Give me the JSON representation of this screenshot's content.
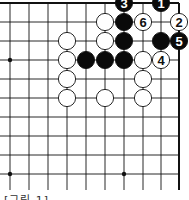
{
  "diagram": {
    "type": "go-board-partial",
    "corner": "top-right",
    "columns_x": [
      10,
      29,
      48,
      67,
      86,
      105,
      124,
      143,
      161,
      179
    ],
    "rows_y": [
      3,
      22,
      41,
      60,
      79,
      98,
      117,
      136,
      155,
      174
    ],
    "edges": {
      "top": true,
      "right": true,
      "left": false,
      "bottom": false
    },
    "star_points": [
      {
        "col": 0,
        "row": 3
      },
      {
        "col": 0,
        "row": 9
      },
      {
        "col": 6,
        "row": 9
      }
    ],
    "stones": [
      {
        "col": 6,
        "row": 0,
        "color": "black",
        "label": "3"
      },
      {
        "col": 8,
        "row": 0,
        "color": "black",
        "label": "1"
      },
      {
        "col": 5,
        "row": 1,
        "color": "white",
        "label": ""
      },
      {
        "col": 6,
        "row": 1,
        "color": "black",
        "label": ""
      },
      {
        "col": 7,
        "row": 1,
        "color": "white",
        "label": "6"
      },
      {
        "col": 9,
        "row": 1,
        "color": "white",
        "label": "2"
      },
      {
        "col": 3,
        "row": 2,
        "color": "white",
        "label": ""
      },
      {
        "col": 5,
        "row": 2,
        "color": "white",
        "label": ""
      },
      {
        "col": 6,
        "row": 2,
        "color": "black",
        "label": ""
      },
      {
        "col": 8,
        "row": 2,
        "color": "black",
        "label": ""
      },
      {
        "col": 9,
        "row": 2,
        "color": "black",
        "label": "5"
      },
      {
        "col": 3,
        "row": 3,
        "color": "white",
        "label": ""
      },
      {
        "col": 4,
        "row": 3,
        "color": "black",
        "label": ""
      },
      {
        "col": 5,
        "row": 3,
        "color": "black",
        "label": ""
      },
      {
        "col": 6,
        "row": 3,
        "color": "black",
        "label": ""
      },
      {
        "col": 7,
        "row": 3,
        "color": "white",
        "label": ""
      },
      {
        "col": 8,
        "row": 3,
        "color": "white",
        "label": "4"
      },
      {
        "col": 3,
        "row": 4,
        "color": "white",
        "label": ""
      },
      {
        "col": 7,
        "row": 4,
        "color": "white",
        "label": ""
      },
      {
        "col": 3,
        "row": 5,
        "color": "white",
        "label": ""
      },
      {
        "col": 5,
        "row": 5,
        "color": "white",
        "label": ""
      },
      {
        "col": 7,
        "row": 5,
        "color": "white",
        "label": ""
      }
    ],
    "colors": {
      "line": "#111111",
      "black_stone": "#0a0a0a",
      "white_stone": "#ffffff",
      "stone_outline": "#111111"
    }
  },
  "caption": "[그림 1]"
}
